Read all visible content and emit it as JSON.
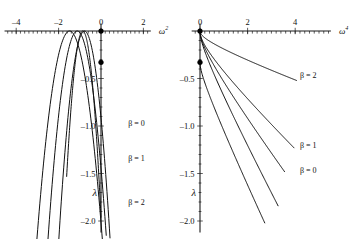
{
  "figure": {
    "background_color": "#ffffff",
    "stroke_color": "#111111",
    "width": 354,
    "height": 239
  },
  "chart_data": [
    {
      "id": "left",
      "type": "line",
      "title": "",
      "xlabel": "ω",
      "xlabel_exponent": "2",
      "ylabel": "λ",
      "xlim": [
        -4.55,
        2.35
      ],
      "ylim": [
        -2.12,
        0.08
      ],
      "grid": false,
      "legend_position": "inline-right",
      "xticks": [
        -4,
        -2,
        0,
        2
      ],
      "xtick_labels": [
        "–4",
        "–2",
        "0",
        "2"
      ],
      "yticks": [
        -0.5,
        -1.0,
        -1.5,
        -2.0
      ],
      "ytick_labels": [
        "–0.5",
        "–1.0",
        "–1.5",
        "–2.0"
      ],
      "minor_tick_step": 0.2,
      "markers": [
        {
          "x": 0,
          "y": 0,
          "name": "origin-marker"
        },
        {
          "x": 0,
          "y": -0.33,
          "name": "lower-branch-marker"
        }
      ],
      "series": [
        {
          "name": "β = 0",
          "label": "β = 0",
          "label_at": {
            "x": 1.28,
            "y": -0.97
          },
          "vertex": {
            "x": -1.48,
            "y": 0.0
          },
          "curvature": -0.92,
          "x_from": -4.45,
          "x_to": 1.12
        },
        {
          "name": "β = 1",
          "label": "β = 1",
          "label_at": {
            "x": 1.28,
            "y": -1.34
          },
          "vertex": {
            "x": -1.12,
            "y": 0.0
          },
          "curvature": -1.15,
          "x_from": -4.05,
          "x_to": 1.12
        },
        {
          "name": "β = 2",
          "label": "β = 2",
          "label_at": {
            "x": 1.28,
            "y": -1.8
          },
          "vertex": {
            "x": -0.78,
            "y": 0.0
          },
          "curvature": -1.5,
          "x_from": -3.6,
          "x_to": 1.0
        },
        {
          "name": "lower-branch",
          "label": "",
          "label_at": null,
          "vertex": {
            "x": -0.86,
            "y": 0.0
          },
          "curvature": -2.65,
          "x_from": -1.62,
          "x_to": 0.0,
          "through_marker": true
        }
      ]
    },
    {
      "id": "right",
      "type": "line",
      "title": "",
      "xlabel": "ω",
      "xlabel_exponent": "4",
      "ylabel": "λ",
      "xlim": [
        -0.35,
        5.5
      ],
      "ylim": [
        -2.12,
        0.08
      ],
      "grid": false,
      "legend_position": "inline-right",
      "xticks": [
        0,
        2,
        4
      ],
      "xtick_labels": [
        "0",
        "2",
        "4"
      ],
      "yticks": [
        -0.5,
        -1.0,
        -1.5,
        -2.0
      ],
      "ytick_labels": [
        "–0.5",
        "–1.0",
        "–1.5",
        "–2.0"
      ],
      "minor_tick_step": 0.2,
      "markers": [
        {
          "x": 0,
          "y": 0,
          "name": "origin-marker"
        },
        {
          "x": 0,
          "y": -0.33,
          "name": "lower-branch-marker"
        }
      ],
      "series": [
        {
          "name": "β = 2",
          "label": "β = 2",
          "label_at": {
            "x": 4.2,
            "y": -0.46
          },
          "start": {
            "x": 0,
            "y": 0
          },
          "end": {
            "x": 4.05,
            "y": -0.52
          },
          "knee": 0.38,
          "linear_tail": 0.62
        },
        {
          "name": "β = 1",
          "label": "β = 1",
          "label_at": {
            "x": 4.2,
            "y": -1.2
          },
          "start": {
            "x": 0,
            "y": 0
          },
          "end": {
            "x": 3.95,
            "y": -1.23
          },
          "knee": 0.3,
          "linear_tail": 0.7
        },
        {
          "name": "β = 0",
          "label": "β = 0",
          "label_at": {
            "x": 4.2,
            "y": -1.46
          },
          "start": {
            "x": 0,
            "y": 0
          },
          "end": {
            "x": 3.55,
            "y": -1.48
          },
          "knee": 0.26,
          "linear_tail": 0.74
        },
        {
          "name": "unlabeled-steep-1",
          "label": "",
          "label_at": null,
          "start": {
            "x": 0,
            "y": 0
          },
          "end": {
            "x": 3.28,
            "y": -1.84
          },
          "knee": 0.22,
          "linear_tail": 0.78
        },
        {
          "name": "lower-branch",
          "label": "",
          "label_at": null,
          "start": {
            "x": 0,
            "y": -0.33
          },
          "end": {
            "x": 2.72,
            "y": -2.02
          },
          "knee": 0.2,
          "linear_tail": 0.8
        }
      ]
    }
  ]
}
